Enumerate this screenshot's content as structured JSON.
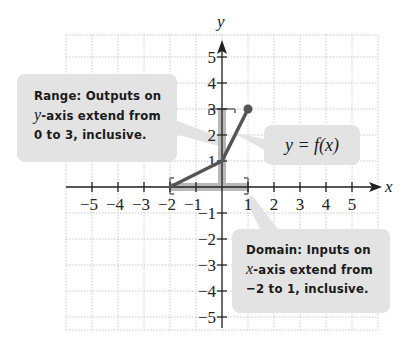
{
  "chart_data": {
    "type": "line",
    "title": "",
    "xlabel": "x",
    "ylabel": "y",
    "xlim": [
      -6,
      6
    ],
    "ylim": [
      -5.5,
      6
    ],
    "grid": true,
    "x_ticks": [
      -5,
      -4,
      -3,
      -2,
      -1,
      1,
      2,
      3,
      4,
      5
    ],
    "y_ticks": [
      -5,
      -4,
      -3,
      -2,
      -1,
      1,
      2,
      3,
      4,
      5
    ],
    "x_tick_labels": [
      "−5",
      "−4",
      "−3",
      "−2",
      "−1",
      "1",
      "2",
      "3",
      "4",
      "5"
    ],
    "y_tick_labels": [
      "−5",
      "−4",
      "−3",
      "−2",
      "−1",
      "1",
      "2",
      "3",
      "4",
      "5"
    ],
    "series": [
      {
        "name": "y = f(x)",
        "x": [
          -2,
          0,
          1
        ],
        "y": [
          0,
          1,
          3
        ],
        "endpoints": [
          {
            "x": -2,
            "y": 0,
            "closed": true
          },
          {
            "x": 1,
            "y": 3,
            "closed": true
          }
        ]
      }
    ],
    "domain": {
      "min": -2,
      "max": 1,
      "inclusive": true
    },
    "range": {
      "min": 0,
      "max": 3,
      "inclusive": true
    },
    "annotations": [
      "Range: Outputs on y-axis extend from 0 to 3, inclusive.",
      "y = f(x)",
      "Domain: Inputs on x-axis extend from −2 to 1, inclusive."
    ]
  },
  "axis_labels": {
    "x": "x",
    "y": "y"
  },
  "callouts": {
    "range": {
      "line1": "Range: Outputs on",
      "var": "y",
      "line2_rest": "-axis extend from",
      "line3": "0 to 3, inclusive."
    },
    "function": {
      "label": "y = f(x)"
    },
    "domain": {
      "line1": "Domain: Inputs on",
      "var": "x",
      "line2_rest": "-axis extend from",
      "line3": "−2 to 1, inclusive."
    }
  },
  "colors": {
    "curve": "#555555",
    "highlight": "#b8b8b8",
    "callout_bg": "#e3e3e3",
    "grid": "#c8c8c8",
    "axis": "#222222"
  }
}
